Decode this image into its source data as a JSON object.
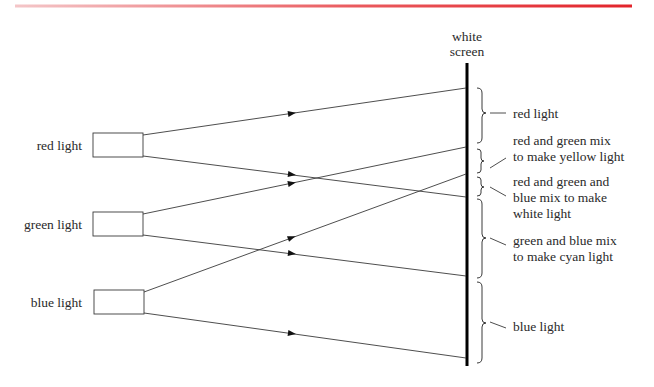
{
  "header": {
    "bar_color_start": "#f4c6c8",
    "bar_color_end": "#e2242b"
  },
  "screen": {
    "label_line1": "white",
    "label_line2": "screen"
  },
  "sources": [
    {
      "label": "red light"
    },
    {
      "label": "green light"
    },
    {
      "label": "blue light"
    }
  ],
  "regions": [
    {
      "lines": [
        "red light"
      ]
    },
    {
      "lines": [
        "red and green mix",
        "to make yellow light"
      ]
    },
    {
      "lines": [
        "red and green and",
        "blue mix to make",
        "white light"
      ]
    },
    {
      "lines": [
        "green and blue mix",
        "to make cyan light"
      ]
    },
    {
      "lines": [
        "blue light"
      ]
    }
  ]
}
